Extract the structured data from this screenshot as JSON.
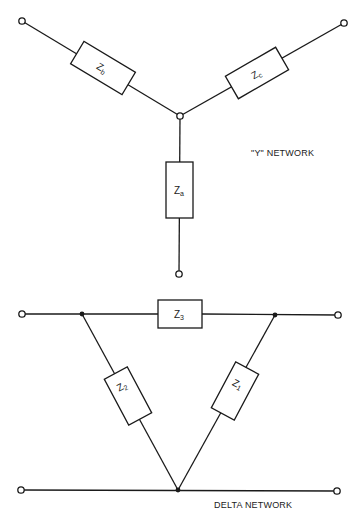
{
  "y_network": {
    "caption": "\"Y\" NETWORK",
    "impedances": [
      {
        "id": "za",
        "base": "Z",
        "sub": "a"
      },
      {
        "id": "zb",
        "base": "Z",
        "sub": "b"
      },
      {
        "id": "zc",
        "base": "Z",
        "sub": "c"
      }
    ]
  },
  "delta_network": {
    "caption": "DELTA NETWORK",
    "impedances": [
      {
        "id": "z1",
        "base": "Z",
        "sub": "1"
      },
      {
        "id": "z2",
        "base": "Z",
        "sub": "2"
      },
      {
        "id": "z3",
        "base": "Z",
        "sub": "3"
      }
    ]
  },
  "colors": {
    "line": "#1a1a1a",
    "background": "#ffffff"
  }
}
